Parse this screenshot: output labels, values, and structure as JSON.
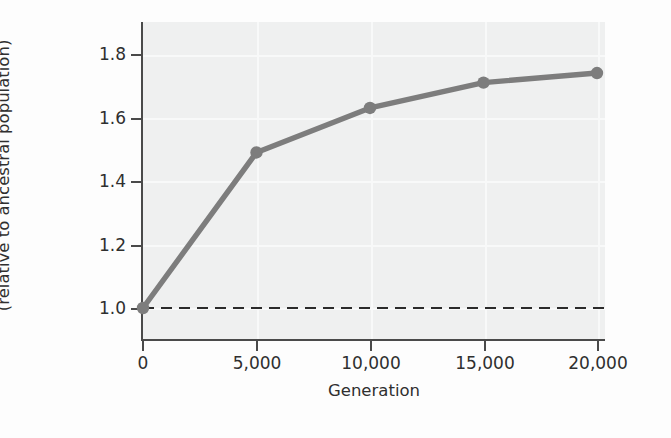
{
  "chart_data": {
    "type": "line",
    "title": "",
    "xlabel": "Generation",
    "ylabel": "Population growth rate (relative to ancestral population)",
    "ylabel_line1": "Population growth rate",
    "ylabel_line2": "(relative to ancestral population)",
    "x": [
      0,
      5000,
      10000,
      15000,
      20000
    ],
    "values": [
      1.0,
      1.49,
      1.63,
      1.71,
      1.74
    ],
    "series": [
      {
        "name": "Population growth rate",
        "x": [
          0,
          5000,
          10000,
          15000,
          20000
        ],
        "values": [
          1.0,
          1.49,
          1.63,
          1.71,
          1.74
        ],
        "color": "#7d7d7d",
        "marker": "circle"
      }
    ],
    "reference_line": {
      "name": "ancestral-baseline",
      "orientation": "horizontal",
      "value": 1.0,
      "style": "dashed",
      "color": "#2b2b2b"
    },
    "xlim": [
      0,
      20000
    ],
    "ylim": [
      0.9,
      1.9
    ],
    "xticks": [
      0,
      5000,
      10000,
      15000,
      20000
    ],
    "xtick_labels": [
      "0",
      "5,000",
      "10,000",
      "15,000",
      "20,000"
    ],
    "yticks": [
      1.0,
      1.2,
      1.4,
      1.6,
      1.8
    ],
    "ytick_labels": [
      "1.0",
      "1.2",
      "1.4",
      "1.6",
      "1.8"
    ],
    "grid": true,
    "grid_color": "#f8f9f9",
    "legend": false,
    "plot_background": "#eff0f0",
    "axis_color": "#4a4a4a"
  }
}
